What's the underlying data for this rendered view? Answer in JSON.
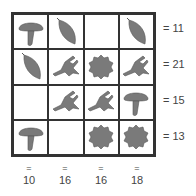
{
  "puzzle": {
    "rows": [
      [
        "mushroom",
        "leaf",
        "",
        "leaf"
      ],
      [
        "leaf",
        "bird",
        "flower",
        "bird"
      ],
      [
        "",
        "bird",
        "bird",
        "mushroom"
      ],
      [
        "mushroom",
        "",
        "flower",
        "flower"
      ]
    ],
    "row_sums": [
      "= 11",
      "= 21",
      "= 15",
      "= 13"
    ],
    "col_eq": [
      "=",
      "=",
      "=",
      "="
    ],
    "col_sums": [
      "10",
      "16",
      "16",
      "18"
    ],
    "icon_color": "#7a7a7a"
  }
}
